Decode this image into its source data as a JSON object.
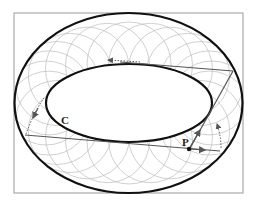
{
  "diagram": {
    "labels": {
      "caustic": "C",
      "point": "P"
    },
    "colors": {
      "boundary": "#111111",
      "trajectory": "#555555",
      "arcs": "#bbbbbb",
      "frame": "#999999"
    },
    "arc_count": 24
  }
}
